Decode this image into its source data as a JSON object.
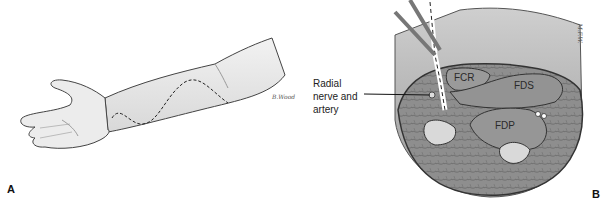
{
  "panel_a": {
    "letter": "A",
    "subject": "forearm-supinated-with-dashed-incision-line",
    "signature": "B.Wood"
  },
  "panel_b": {
    "letter": "B",
    "subject": "forearm-cross-section",
    "callout": {
      "line1": "Radial",
      "line2": "nerve and",
      "line3": "artery"
    },
    "labels": {
      "fcr": "FCR",
      "fds": "FDS",
      "fdp": "FDP"
    },
    "signature": "M.F.W."
  },
  "colors": {
    "background": "#ffffff",
    "muscle": "#8a8a8a",
    "bone": "#d9d9d9",
    "outline": "#333333"
  }
}
